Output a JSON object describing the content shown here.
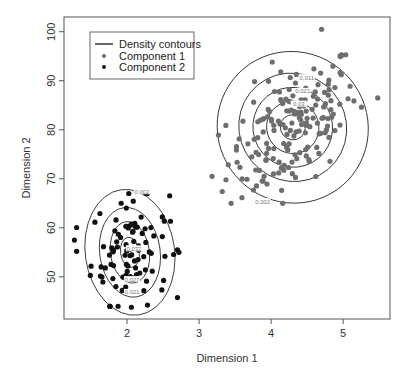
{
  "chart_data": {
    "type": "scatter",
    "title": "",
    "xlabel": "Dimension 1",
    "ylabel": "Dimension 2",
    "xlim": [
      1.125,
      5.65
    ],
    "ylim": [
      41.4,
      103.0
    ],
    "xticks": [
      2,
      3,
      4,
      5
    ],
    "yticks": [
      50,
      60,
      70,
      80,
      90,
      100
    ],
    "grid": false,
    "legend_position": "top-left",
    "legend": [
      {
        "label": "Density contours",
        "type": "line",
        "color": "#222222"
      },
      {
        "label": "Component 1",
        "type": "point",
        "color": "#6e6e6e"
      },
      {
        "label": "Component 2",
        "type": "point",
        "color": "#111111"
      }
    ],
    "series": [
      {
        "name": "Component 1",
        "color": "#6e6e6e",
        "n_points": 175,
        "center": [
          4.3,
          80.5
        ],
        "sd": [
          0.45,
          7.2
        ],
        "correlation": 0.5,
        "x_range": [
          3.2,
          5.5
        ],
        "y_range": [
          65,
          101
        ]
      },
      {
        "name": "Component 2",
        "color": "#111111",
        "n_points": 95,
        "center": [
          2.04,
          55.5
        ],
        "sd": [
          0.27,
          5.7
        ],
        "correlation": 0.1,
        "x_range": [
          1.3,
          2.7
        ],
        "y_range": [
          44,
          67
        ]
      }
    ],
    "contours": [
      {
        "component": "Component 1",
        "center": [
          4.3,
          80.5
        ],
        "levels": [
          {
            "label": "0.002",
            "rx": 1.04,
            "ry": 15.6
          },
          {
            "label": "0.011",
            "rx": 0.74,
            "ry": 11.2
          },
          {
            "label": "0.021",
            "rx": 0.55,
            "ry": 8.2
          },
          {
            "label": "0.03",
            "rx": 0.36,
            "ry": 5.4
          },
          {
            "label": "",
            "rx": 0.17,
            "ry": 2.6
          }
        ],
        "tilt_deg": -40
      },
      {
        "component": "Component 2",
        "center": [
          2.04,
          55.0
        ],
        "levels": [
          {
            "label": "0.002",
            "rx": 0.62,
            "ry": 12.9
          },
          {
            "label": "0.021",
            "rx": 0.42,
            "ry": 9.2
          },
          {
            "label": "0.027",
            "rx": 0.27,
            "ry": 6.3
          },
          {
            "label": "0.032",
            "rx": 0.13,
            "ry": 3.1
          }
        ],
        "tilt_deg": -8
      }
    ],
    "outliers": [
      {
        "component": "Component 1",
        "x": 4.7,
        "y": 100.5
      },
      {
        "component": "Component 1",
        "x": 5.48,
        "y": 86.5
      },
      {
        "component": "Component 1",
        "x": 3.18,
        "y": 70.5
      },
      {
        "component": "Component 2",
        "x": 1.27,
        "y": 57.5
      },
      {
        "component": "Component 2",
        "x": 2.72,
        "y": 55.0
      },
      {
        "component": "Component 2",
        "x": 2.06,
        "y": 43.8
      }
    ]
  },
  "axes": {
    "x_title": "Dimension 1",
    "y_title": "Dimension 2",
    "x_tick_labels": [
      "2",
      "3",
      "4",
      "5"
    ],
    "y_tick_labels": [
      "50",
      "60",
      "70",
      "80",
      "90",
      "100"
    ]
  },
  "legend": {
    "items": [
      "Density contours",
      "Component 1",
      "Component 2"
    ]
  }
}
